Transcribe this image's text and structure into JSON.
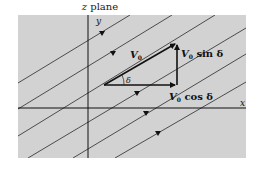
{
  "figure": {
    "title_var": "z",
    "title_rest": " plane",
    "axis_x_label": "x",
    "axis_y_label": "y",
    "vector_label": "V",
    "vector_sub": "0",
    "sin_label": " sin δ",
    "cos_label": " cos δ",
    "angle_label": "δ",
    "colors": {
      "panel": "#d2d2d2",
      "line": "#222222",
      "background": "#ffffff"
    }
  }
}
